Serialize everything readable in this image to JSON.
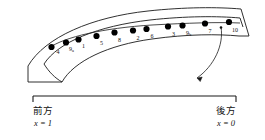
{
  "figure": {
    "stroke_color": "#1a1a1a",
    "dot_color": "#000000",
    "background": "#ffffff",
    "band": {
      "description": "curved outer band and inner band drawn as arcs, open left end closed by a straight edge, right end closed by a slanted edge"
    },
    "dots": [
      {
        "id": "4",
        "label": "4",
        "x": 51.5,
        "y": 47.0,
        "label_x": 56.5,
        "label_y": 49.0
      },
      {
        "id": "9a",
        "label": "9",
        "sub": "a",
        "x": 66.0,
        "y": 42.5,
        "label_x": 69.0,
        "label_y": 45.8
      },
      {
        "id": "1",
        "label": "1",
        "x": 78.5,
        "y": 39.5,
        "label_x": 82.0,
        "label_y": 42.5
      },
      {
        "id": "5",
        "label": "5",
        "x": 96.5,
        "y": 36.0,
        "label_x": 100.0,
        "label_y": 39.5
      },
      {
        "id": "8",
        "label": "8",
        "x": 114.5,
        "y": 32.5,
        "label_x": 118.0,
        "label_y": 36.5
      },
      {
        "id": "2",
        "label": "2",
        "x": 133.0,
        "y": 30.5,
        "label_x": 136.5,
        "label_y": 34.5
      },
      {
        "id": "6",
        "label": "6",
        "x": 146.5,
        "y": 29.0,
        "label_x": 150.5,
        "label_y": 33.0
      },
      {
        "id": "3",
        "label": "3",
        "x": 168.0,
        "y": 26.5,
        "label_x": 172.0,
        "label_y": 30.5
      },
      {
        "id": "9b",
        "label": "9",
        "sub": "b",
        "x": 182.5,
        "y": 25.5,
        "label_x": 186.0,
        "label_y": 29.5
      },
      {
        "id": "7",
        "label": "7",
        "x": 205.0,
        "y": 23.5,
        "label_x": 208.5,
        "label_y": 27.5
      },
      {
        "id": "10",
        "label": "10",
        "x": 229.0,
        "y": 22.0,
        "label_x": 232.0,
        "label_y": 26.5
      }
    ],
    "callout": {
      "name": "curved-leader-arrow",
      "from_marker_x": 221.0,
      "from_marker_y": 27.5,
      "arrow_tip_x": 196.0,
      "arrow_tip_y": 79.0
    },
    "scale_bar": {
      "name": "extent-bracket",
      "left_x": 33.0,
      "right_x": 236.0,
      "y": 96.0,
      "tick_height": 6.0
    },
    "captions": {
      "left": {
        "word": "前方",
        "equation_var": "x",
        "equation_value": "1",
        "equation": "x = 1"
      },
      "right": {
        "word": "後方",
        "equation_var": "x",
        "equation_value": "0",
        "equation": "x = 0"
      }
    }
  }
}
